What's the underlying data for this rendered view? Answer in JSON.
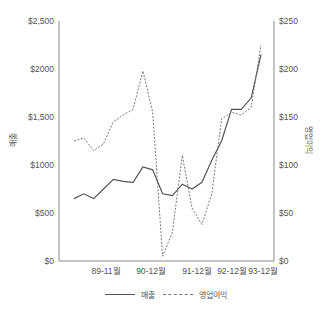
{
  "chart_data": {
    "type": "line",
    "title": "",
    "xlabel": "",
    "ylabel": "매출",
    "ylabel_right": "영업이익",
    "x_tick_labels": [
      "89-11월",
      "90-12월",
      "91-12월",
      "92-12월",
      "93-12월"
    ],
    "left_axis": {
      "ylim": [
        0,
        2500
      ],
      "ticks": [
        "$0",
        "$500",
        "$1000",
        "$1,500",
        "$2000",
        "$2,500"
      ]
    },
    "right_axis": {
      "ylim": [
        0,
        250
      ],
      "ticks": [
        "$0",
        "$50",
        "$100",
        "$150",
        "$200",
        "$250"
      ]
    },
    "grid": false,
    "legend_position": "bottom",
    "series": [
      {
        "name": "매출",
        "axis": "left",
        "style": "solid",
        "values": [
          650,
          700,
          650,
          750,
          850,
          830,
          820,
          980,
          950,
          700,
          680,
          800,
          750,
          820,
          1050,
          1250,
          1580,
          1580,
          1700,
          2150
        ]
      },
      {
        "name": "영업이익",
        "axis": "right",
        "style": "dashed",
        "values": [
          125,
          128,
          115,
          122,
          145,
          152,
          158,
          198,
          155,
          5,
          30,
          110,
          55,
          38,
          70,
          148,
          155,
          152,
          160,
          225
        ]
      }
    ]
  },
  "legend": {
    "items": [
      {
        "label": "매출",
        "style": "solid"
      },
      {
        "label": "영업이익",
        "style": "dashed"
      }
    ]
  }
}
